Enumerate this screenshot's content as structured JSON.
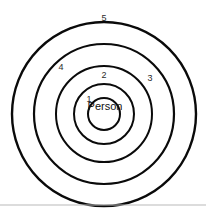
{
  "figure": {
    "background_color": "#ffffff",
    "stroke_color": "#0a0a0a",
    "label_color": "#2b2b2b",
    "divider_color": "#b9b9b9",
    "center_label": "Person"
  },
  "chart_data": {
    "type": "diagram",
    "title": "",
    "center": {
      "x": 104,
      "y": 114,
      "label": "Person"
    },
    "rings": [
      {
        "label": "1",
        "radius": 16,
        "stroke_width": 2.0,
        "label_x": 89,
        "label_y": 100
      },
      {
        "label": "2",
        "radius": 30,
        "stroke_width": 2.0,
        "label_x": 104,
        "label_y": 76
      },
      {
        "label": "3",
        "radius": 48,
        "stroke_width": 2.0,
        "label_x": 150,
        "label_y": 79
      },
      {
        "label": "4",
        "radius": 70,
        "stroke_width": 2.2,
        "label_x": 61,
        "label_y": 68
      },
      {
        "label": "5",
        "radius": 92,
        "stroke_width": 2.4,
        "label_x": 104,
        "label_y": 19
      }
    ],
    "divider": {
      "x1": 0,
      "y1": 205,
      "x2": 206,
      "y2": 205
    }
  }
}
